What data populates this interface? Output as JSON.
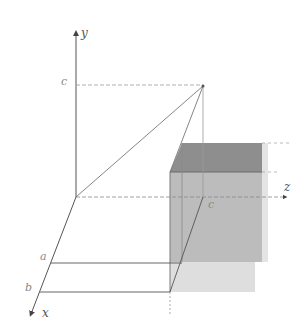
{
  "diagram": {
    "axes": {
      "y": {
        "label": "y"
      },
      "x": {
        "label": "x"
      },
      "z": {
        "label": "z"
      }
    },
    "marks": {
      "c_on_y": "c",
      "c_on_z": "c",
      "a_on_x": "a",
      "b_on_x": "b"
    },
    "colors": {
      "axis": "#555555",
      "dashed": "#9a9a9a",
      "box_top": "#8c8c8c",
      "box_front": "#bdbdbd",
      "box_front_light": "#dcdcdc",
      "box_side": "#d6d6d6"
    }
  }
}
